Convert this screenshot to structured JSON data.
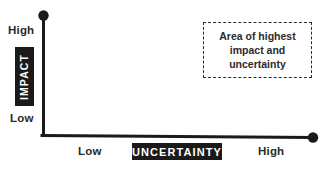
{
  "diagram": {
    "type": "impact-uncertainty-matrix",
    "background_color": "#ffffff",
    "ink_color": "#1a1a1a",
    "text_color": "#2b2b2b",
    "y_axis": {
      "title": "IMPACT",
      "high_label": "High",
      "low_label": "Low"
    },
    "x_axis": {
      "title": "UNCERTAINTY",
      "low_label": "Low",
      "high_label": "High"
    },
    "callout": {
      "lines": [
        "Area of highest",
        "impact and",
        "uncertainty"
      ]
    }
  }
}
